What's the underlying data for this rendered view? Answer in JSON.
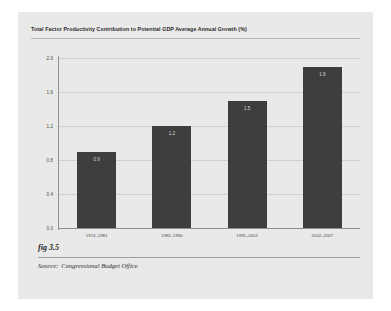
{
  "figure": {
    "label": "fig 3.5",
    "source_label": "Source:",
    "source_value": "Congressional Budget Office"
  },
  "chart_data": {
    "type": "bar",
    "title": "Total Factor Productivity Contribution to Potential GDP Average Annual Growth (%)",
    "xlabel": "",
    "ylabel": "",
    "categories": [
      "1974–1981",
      "1982–1990",
      "1991–2001",
      "2002–2007"
    ],
    "values": [
      0.9,
      1.2,
      1.5,
      1.9
    ],
    "value_labels": [
      "0.9",
      "1.2",
      "1.5",
      "1.9"
    ],
    "ylim": [
      0.0,
      2.0
    ],
    "yticks": [
      0.0,
      0.4,
      0.8,
      1.2,
      1.6,
      2.0
    ],
    "ytick_labels": [
      "0.0",
      "0.4",
      "0.8",
      "1.2",
      "1.6",
      "2.0"
    ],
    "grid": true,
    "legend": false,
    "bar_color": "#3e3e3e",
    "plot_background": "#e9e9e9",
    "page_background": "#e9e9e9"
  }
}
